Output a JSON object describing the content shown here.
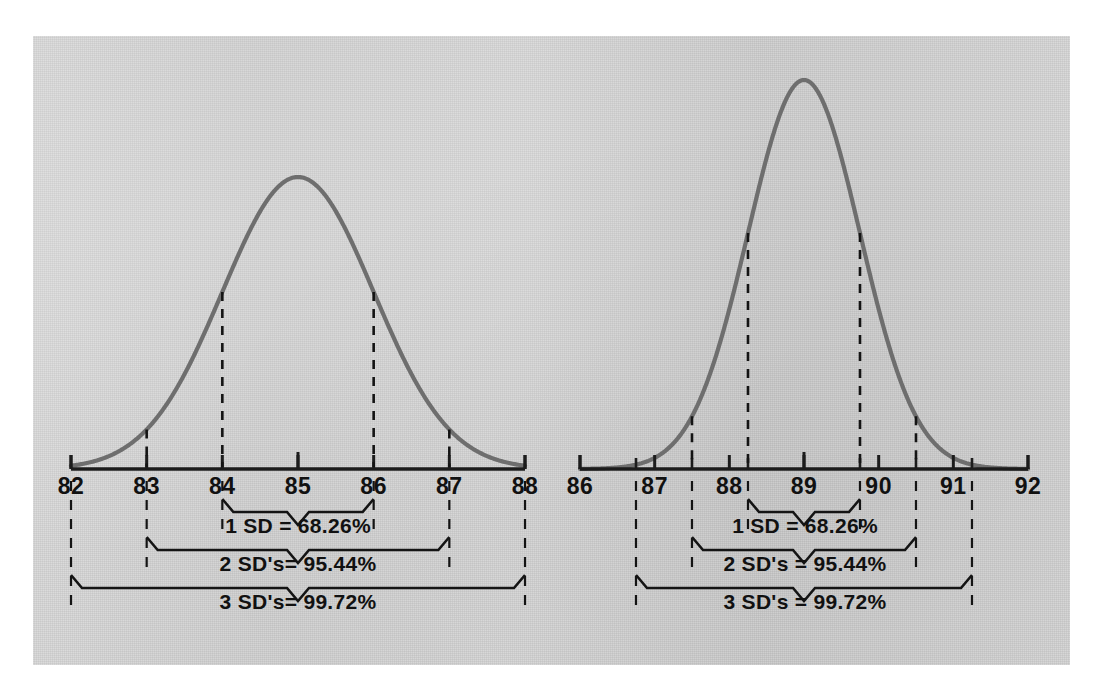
{
  "figure": {
    "background_color": "#d3d3d3",
    "curve_color": "#6e6e6e",
    "ink_color": "#141414",
    "panel_count": 2
  },
  "chart_data": [
    {
      "type": "line",
      "title": "",
      "subtitle": "",
      "xlabel": "",
      "ylabel": "",
      "distribution": "normal",
      "mean": 85,
      "sd": 1.0,
      "xlim": [
        82,
        88
      ],
      "ylim": [
        0,
        1
      ],
      "grid": false,
      "legend": "none",
      "tick_labels": [
        "82",
        "83",
        "84",
        "85",
        "86",
        "87",
        "88"
      ],
      "tick_values": [
        82,
        83,
        84,
        85,
        86,
        87,
        88
      ],
      "sd_markers": [
        {
          "label": "-3 SD",
          "x": 82
        },
        {
          "label": "-2 SD",
          "x": 83
        },
        {
          "label": "-1 SD",
          "x": 84
        },
        {
          "label": "mean",
          "x": 85
        },
        {
          "label": "+1 SD",
          "x": 86
        },
        {
          "label": "+2 SD",
          "x": 87
        },
        {
          "label": "+3 SD",
          "x": 88
        }
      ],
      "annotations": [
        {
          "id": "sd1",
          "text": "1  SD = 68.26%",
          "span": [
            84,
            86
          ],
          "percent": 68.26,
          "sd": 1
        },
        {
          "id": "sd2",
          "text": "2  SD's= 95.44%",
          "span": [
            83,
            87
          ],
          "percent": 95.44,
          "sd": 2
        },
        {
          "id": "sd3",
          "text": "3  SD's= 99.72%",
          "span": [
            82,
            88
          ],
          "percent": 99.72,
          "sd": 3
        }
      ]
    },
    {
      "type": "line",
      "title": "",
      "subtitle": "",
      "xlabel": "",
      "ylabel": "",
      "distribution": "normal",
      "mean": 89,
      "sd": 0.75,
      "xlim": [
        86,
        92
      ],
      "ylim": [
        0,
        1
      ],
      "grid": false,
      "legend": "none",
      "tick_labels": [
        "86",
        "87",
        "88",
        "89",
        "90",
        "91",
        "92"
      ],
      "tick_values": [
        86,
        87,
        88,
        89,
        90,
        91,
        92
      ],
      "sd_markers": [
        {
          "label": "-3 SD",
          "x": 86.75
        },
        {
          "label": "-2 SD",
          "x": 87.5
        },
        {
          "label": "-1 SD",
          "x": 88.25
        },
        {
          "label": "mean",
          "x": 89
        },
        {
          "label": "+1 SD",
          "x": 89.75
        },
        {
          "label": "+2 SD",
          "x": 90.5
        },
        {
          "label": "+3 SD",
          "x": 91.25
        }
      ],
      "annotations": [
        {
          "id": "sd1",
          "text": "1  SD = 68.26%",
          "span": [
            88.25,
            89.75
          ],
          "percent": 68.26,
          "sd": 1
        },
        {
          "id": "sd2",
          "text": "2  SD's = 95.44%",
          "span": [
            87.5,
            90.5
          ],
          "percent": 95.44,
          "sd": 2
        },
        {
          "id": "sd3",
          "text": "3  SD's = 99.72%",
          "span": [
            86.75,
            91.25
          ],
          "percent": 99.72,
          "sd": 3
        }
      ]
    }
  ],
  "left_chart": {
    "ticks": [
      {
        "label": "82"
      },
      {
        "label": "83"
      },
      {
        "label": "84"
      },
      {
        "label": "85"
      },
      {
        "label": "86"
      },
      {
        "label": "87"
      },
      {
        "label": "88"
      }
    ],
    "sd1_label": "1  SD = 68.26%",
    "sd2_label": "2  SD's= 95.44%",
    "sd3_label": "3  SD's= 99.72%"
  },
  "right_chart": {
    "ticks": [
      {
        "label": "86"
      },
      {
        "label": "87"
      },
      {
        "label": "88"
      },
      {
        "label": "89"
      },
      {
        "label": "90"
      },
      {
        "label": "91"
      },
      {
        "label": "92"
      }
    ],
    "sd1_label": "1  SD = 68.26%",
    "sd2_label": "2  SD's = 95.44%",
    "sd3_label": "3  SD's = 99.72%"
  }
}
